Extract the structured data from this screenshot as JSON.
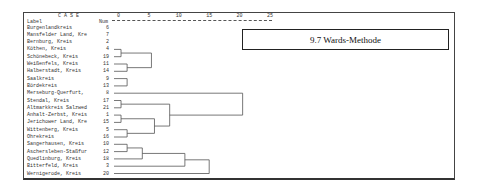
{
  "title": "9.7 Wards-Methode",
  "header": {
    "case": "C A S E",
    "label": "Label",
    "num": "Num"
  },
  "chart_data": {
    "type": "dendrogram",
    "title": "9.7 Wards-Methode",
    "xlabel": "Rescaled Distance Cluster Combine",
    "ticks": [
      "0",
      "5",
      "10",
      "15",
      "20",
      "25"
    ],
    "xlim": [
      0,
      25
    ],
    "leaves": [
      {
        "label": "Burgenlandkreis",
        "num": "6"
      },
      {
        "label": "Mansfelder Land, Kre",
        "num": "7"
      },
      {
        "label": "Bernburg, Kreis",
        "num": "2"
      },
      {
        "label": "Köthen, Kreis",
        "num": "4"
      },
      {
        "label": "Schönebeck, Kreis",
        "num": "19"
      },
      {
        "label": "Weißenfels, Kreis",
        "num": "11"
      },
      {
        "label": "Halberstadt, Kreis",
        "num": "14"
      },
      {
        "label": "Saalkreis",
        "num": "9"
      },
      {
        "label": "Bördekreis",
        "num": "13"
      },
      {
        "label": "Merseburg-Querfurt,",
        "num": "8"
      },
      {
        "label": "Stendal, Kreis",
        "num": "17"
      },
      {
        "label": "Altmarkkreis Salzwed",
        "num": "21"
      },
      {
        "label": "Anhalt-Zerbst, Kreis",
        "num": "1"
      },
      {
        "label": "Jerichower Land, Kre",
        "num": "15"
      },
      {
        "label": "Wittenberg, Kreis",
        "num": "5"
      },
      {
        "label": "Ohrekreis",
        "num": "16"
      },
      {
        "label": "Sangerhausen, Kreis",
        "num": "10"
      },
      {
        "label": "Aschersleben-Staßfur",
        "num": "12"
      },
      {
        "label": "Quedlinburg, Kreis",
        "num": "18"
      },
      {
        "label": "Bitterfeld, Kreis",
        "num": "3"
      },
      {
        "label": "Wernigerode, Kreis",
        "num": "20"
      }
    ],
    "merges": [
      {
        "a": [
          0
        ],
        "b": [
          1,
          2
        ],
        "distance": 1
      },
      {
        "a": [
          3
        ],
        "b": [
          4
        ],
        "distance": 0.5
      },
      {
        "a": [
          5
        ],
        "b": [
          6
        ],
        "distance": 1.5
      },
      {
        "a": [
          3,
          4
        ],
        "b": [
          5,
          6
        ],
        "distance": 5.5
      },
      {
        "a": [
          0,
          1,
          2
        ],
        "b": [
          3,
          4,
          5,
          6
        ],
        "distance": 9
      },
      {
        "a": [
          7
        ],
        "b": [
          8
        ],
        "distance": 1.5
      },
      {
        "a": [
          0,
          1,
          2,
          3,
          4,
          5,
          6
        ],
        "b": [
          7,
          8
        ],
        "distance": 14
      },
      {
        "a": [
          10
        ],
        "b": [
          11
        ],
        "distance": 0.5
      },
      {
        "a": [
          12
        ],
        "b": [
          13
        ],
        "distance": 0.5
      },
      {
        "a": [
          14
        ],
        "b": [
          15
        ],
        "distance": 1.5
      },
      {
        "a": [
          12,
          13
        ],
        "b": [
          14,
          15
        ],
        "distance": 6
      },
      {
        "a": [
          10,
          11
        ],
        "b": [
          12,
          13,
          14,
          15
        ],
        "distance": 8.5
      },
      {
        "a": [
          9
        ],
        "b": [
          10,
          11,
          12,
          13,
          14,
          15
        ],
        "distance": 20.5
      },
      {
        "a": [
          16
        ],
        "b": [
          17
        ],
        "distance": 1.5
      },
      {
        "a": [
          16,
          17
        ],
        "b": [
          18
        ],
        "distance": 4
      },
      {
        "a": [
          16,
          17,
          18
        ],
        "b": [
          19
        ],
        "distance": 11
      },
      {
        "a": [
          16,
          17,
          18,
          19
        ],
        "b": [
          20
        ],
        "distance": 15
      },
      {
        "a": [
          0,
          1,
          2,
          3,
          4,
          5,
          6,
          7,
          8
        ],
        "b": [
          9,
          10,
          11,
          12,
          13,
          14,
          15
        ],
        "distance": 21
      },
      {
        "a": [
          0,
          1,
          2,
          3,
          4,
          5,
          6,
          7,
          8,
          9,
          10,
          11,
          12,
          13,
          14,
          15
        ],
        "b": [
          16,
          17,
          18,
          19,
          20
        ],
        "distance": 25
      }
    ]
  }
}
